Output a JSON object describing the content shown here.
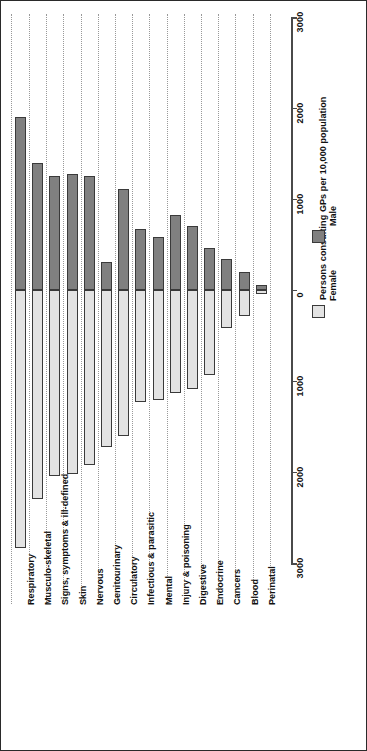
{
  "chart_data": {
    "type": "bar",
    "title": "",
    "subtitle": "",
    "xlabel": "",
    "ylabel": "Persons consulting GPs per 10,000 population",
    "orientation": "diverging-vertical",
    "grid": true,
    "legend_position": "right",
    "axis": {
      "label": "Persons consulting GPs per 10,000 population",
      "ticks": [
        3000,
        2000,
        1000,
        0,
        1000,
        2000,
        3000
      ],
      "tick_labels": [
        "3000",
        "2000",
        "1000",
        "0",
        "1000",
        "2000",
        "3000"
      ],
      "range": [
        -3000,
        3000
      ],
      "zero_value": "0"
    },
    "categories": [
      "Respiratory",
      "Musculo-skeletal",
      "Signs, symptoms & ill-defined",
      "Skin",
      "Nervous",
      "Genitourinary",
      "Circulatory",
      "Infectious & parasitic",
      "Mental",
      "Injury & poisoning",
      "Digestive",
      "Endocrine",
      "Cancers",
      "Blood",
      "Perinatal"
    ],
    "series": [
      {
        "name": "Male",
        "color": "#808080",
        "values": [
          1900,
          1400,
          1250,
          1280,
          1250,
          310,
          1110,
          670,
          580,
          825,
          700,
          460,
          340,
          195,
          55
        ]
      },
      {
        "name": "Female",
        "color": "#e3e3e3",
        "values": [
          2840,
          2300,
          2040,
          2020,
          1920,
          1720,
          1600,
          1230,
          1210,
          1130,
          1090,
          930,
          420,
          290,
          45
        ]
      }
    ]
  },
  "legend": {
    "entries": [
      {
        "label": "Male",
        "swatch": "male"
      },
      {
        "label": "Female",
        "swatch": "female"
      }
    ]
  }
}
